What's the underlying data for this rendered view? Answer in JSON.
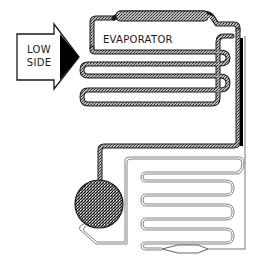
{
  "diagram": {
    "type": "refrigeration-system-schematic",
    "arrow_label": {
      "line1": "LOW",
      "line2": "SIDE"
    },
    "component_label": "EVAPORATOR",
    "colors": {
      "line": "#1a1a1a",
      "stipple": "#7a7a7a",
      "background": "#ffffff",
      "arrow_fill": "#000000"
    }
  }
}
